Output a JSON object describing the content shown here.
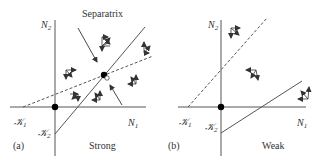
{
  "panels": [
    {
      "id": "a",
      "tag": "(a)",
      "caption": "Strong",
      "title": "Separatrix",
      "x_axis_label": "N",
      "x_axis_sub": "1",
      "y_axis_label": "N",
      "y_axis_sub": "2",
      "k1_label": "𝒦",
      "k1_sub": "1",
      "k2_label": "𝒦",
      "k2_sub": "2"
    },
    {
      "id": "b",
      "tag": "(b)",
      "caption": "Weak",
      "x_axis_label": "N",
      "x_axis_sub": "1",
      "y_axis_label": "N",
      "y_axis_sub": "2",
      "k1_label": "𝒦",
      "k1_sub": "1",
      "k2_label": "𝒦",
      "k2_sub": "2"
    }
  ],
  "colors": {
    "line": "#555555",
    "text": "#333333",
    "dot": "#000000"
  }
}
